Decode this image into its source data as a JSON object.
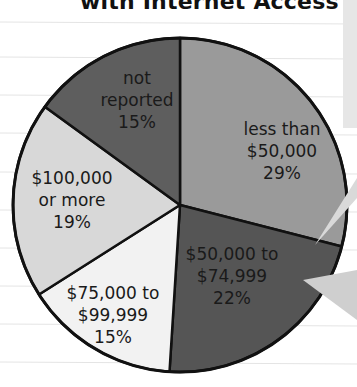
{
  "chart_data": {
    "type": "pie",
    "title": "with Internet Access",
    "categories": [
      "less than $50,000",
      "$50,000 to $74,999",
      "$75,000 to $99,999",
      "$100,000 or more",
      "not reported"
    ],
    "values": [
      29,
      22,
      15,
      19,
      15
    ],
    "unit": "%",
    "start_angle_deg": 0,
    "direction": "clockwise",
    "colors": [
      "#9a9a9a",
      "#555555",
      "#f2f2f2",
      "#d8d8d8",
      "#5e5e5e"
    ],
    "legend": "none (labels inside slices)"
  },
  "labels": {
    "s0": {
      "l1": "less than",
      "l2": "$50,000",
      "l3": "29%"
    },
    "s1": {
      "l1": "$50,000 to",
      "l2": "$74,999",
      "l3": "22%"
    },
    "s2": {
      "l1": "$75,000 to",
      "l2": "$99,999",
      "l3": "15%"
    },
    "s3": {
      "l1": "$100,000",
      "l2": "or more",
      "l3": "19%"
    },
    "s4": {
      "l1": "not",
      "l2": "reported",
      "l3": "15%"
    }
  }
}
